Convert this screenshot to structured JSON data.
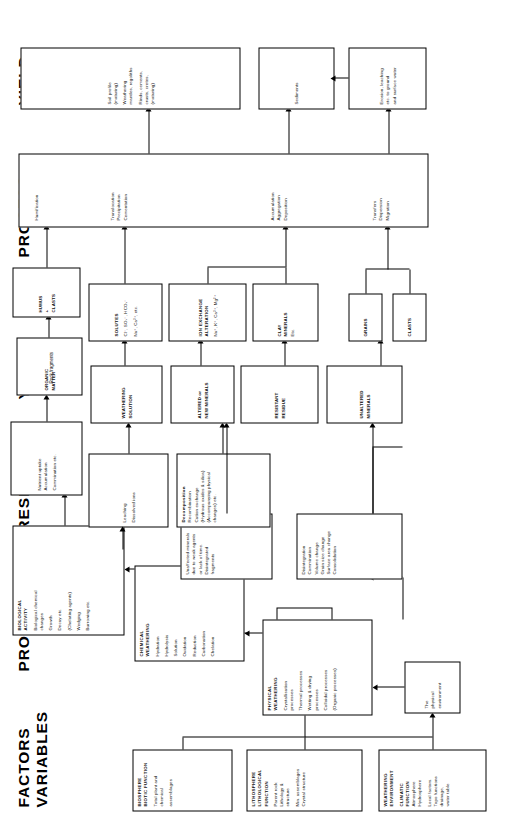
{
  "figure": {
    "column_headers": [
      {
        "id": "factors-variables",
        "label": "FACTORS\nVARIABLES"
      },
      {
        "id": "process-1",
        "label": "PROCESS"
      },
      {
        "id": "response",
        "label": "RESPONSE"
      },
      {
        "id": "yield-1",
        "label": "YIELD"
      },
      {
        "id": "process-2",
        "label": "PROCESS"
      },
      {
        "id": "yield-2",
        "label": "YIELD"
      }
    ],
    "factor_boxes": [
      {
        "id": "weathering-environment-climatic",
        "title": "WEATHERING\nENVIRONMENT",
        "subtitle": "CLIMATIC\nFUNCTION",
        "lines": [
          "Atmosphere",
          "Hydrosphere",
          "",
          "Local factors.",
          "Topo  functions",
          "drainage,",
          "water table"
        ]
      },
      {
        "id": "lithosphere-lithological-function",
        "title": "LITHOSPHERE\nLITHOLOGICAL\nFUNCTION",
        "subtitle": "",
        "lines": [
          "Parent rock",
          "Lithology &",
          "structure",
          "",
          "Min. assemblages",
          "Crystal structure"
        ]
      },
      {
        "id": "biosphere-biotic-function",
        "title": "BIOSPHERE\nBIOTIC FUNCTION",
        "subtitle": "",
        "lines": [
          "Total plant and",
          "chemical",
          "",
          "assemblages"
        ]
      }
    ],
    "environment_boxes": [
      {
        "id": "physical-environment",
        "lines": [
          "The",
          "physical",
          "environment"
        ]
      },
      {
        "id": "chemical-environment",
        "lines": [
          "The",
          "chemical",
          "environment"
        ]
      }
    ],
    "process_boxes": [
      {
        "id": "physical-weathering",
        "title": "PHYSICAL\nWEATHERING",
        "lines": [
          "Crystallisation",
          "processes",
          "",
          "Thermal processes",
          "",
          "Wetting & drying",
          "processes",
          "",
          "Colloidal processes",
          "",
          "(Organic processes)"
        ]
      },
      {
        "id": "chemical-weathering",
        "title": "CHEMICAL\nWEATHERING",
        "lines": [
          "Hydration",
          "",
          "Hydrolysis",
          "",
          "Solution",
          "",
          "Oxidation",
          "",
          "Reduction",
          "",
          "Carbonation",
          "",
          "Chelation"
        ]
      },
      {
        "id": "biological-activity",
        "title": "BIOLOGICAL\nACTIVITY",
        "lines": [
          "Biological chemical",
          "changes",
          "",
          "Growth",
          "",
          "Decay etc.",
          "",
          "(Chelating agents)",
          "",
          "Wedging",
          "",
          "Burrowing etc."
        ]
      }
    ],
    "response_boxes": [
      {
        "id": "physical-response",
        "lines": [
          "Disintegration",
          "Comminution",
          "Volume change",
          "Grain size change",
          "Surface area change",
          "Consolidation"
        ]
      },
      {
        "id": "unaffected-minerals-response",
        "lines": [
          "Unaffected minerals",
          "due to weak agents",
          "or lack of time.",
          "Disintegrated",
          "fragments"
        ]
      },
      {
        "id": "chemical-response",
        "title": "Decomposition",
        "lines": [
          "Recombination",
          "Cation exchange",
          "(Hydrous oxides & silica)",
          "(Accompanying physical",
          "changes) etc."
        ]
      },
      {
        "id": "leaching-response",
        "lines": [
          "Leaching",
          "",
          "Dissolved ions"
        ]
      },
      {
        "id": "biological-response",
        "lines": [
          "Nutrient  uptake",
          "Accumulation",
          "",
          "Comminution etc."
        ]
      }
    ],
    "yield1_boxes": [
      {
        "id": "unaltered-minerals",
        "lines": [
          "UNALTERED",
          "MINERALS"
        ]
      },
      {
        "id": "resistant-residue",
        "lines": [
          "RESISTANT",
          "RESIDUE"
        ]
      },
      {
        "id": "altered-new-minerals",
        "lines": [
          "ALTERED  or",
          "NEW MINERALS"
        ]
      },
      {
        "id": "weathering-solution",
        "lines": [
          "WEATHERING",
          "SOLUTION"
        ]
      },
      {
        "id": "organic-matter",
        "lines": [
          "ORGANIC",
          "MATTER"
        ]
      }
    ],
    "yield1_sub_boxes": [
      {
        "id": "clasts",
        "lines": [
          "CLASTS"
        ]
      },
      {
        "id": "grains",
        "lines": [
          "GRAINS"
        ]
      },
      {
        "id": "clay-minerals",
        "lines": [
          "CLAY",
          "MINERALS",
          "Etc."
        ]
      },
      {
        "id": "ion-exchange-alteration",
        "title": "ION EXCHANGE\nALTERATION",
        "lines": [
          "Na⁺, K⁺, Ca²⁺,  Mg²⁺"
        ]
      },
      {
        "id": "solutes",
        "title": "SOLUTES",
        "lines": [
          "Cl⁻,  SO₄⁻,  HCO₃⁻",
          "",
          "Na⁺, Ca²⁺, etc."
        ]
      },
      {
        "id": "humus-clasts",
        "lines": [
          "HUMUS",
          "+",
          "CLASTS"
        ]
      },
      {
        "id": "rock-fragments",
        "lines": [
          "Rock  fragments"
        ]
      }
    ],
    "process2_box": {
      "id": "transport-process",
      "groups": [
        {
          "lines": [
            "Transfers",
            "Dispersion",
            "Migration"
          ]
        },
        {
          "lines": [
            "Accumulation",
            "Aggregation",
            "Deposition"
          ]
        },
        {
          "lines": [
            "Translocation",
            "Precipitation",
            "Cementation"
          ]
        },
        {
          "lines": [
            "Humification"
          ]
        }
      ]
    },
    "yield2_boxes": [
      {
        "id": "erosion-leaching",
        "lines": [
          "Erosion, leaching",
          "etc. to ground",
          "and surface water"
        ]
      },
      {
        "id": "sediments",
        "lines": [
          "Sediments"
        ]
      },
      {
        "id": "soil-profile",
        "lines": [
          "Soil  profile",
          "(maturing)",
          "",
          "Weathering",
          "mantles, regoliths",
          "",
          "Rinds,  cements,",
          "crusts,  cretes,",
          "(maturing)"
        ]
      }
    ],
    "annotations": [
      {
        "id": "note-question",
        "text": "?"
      }
    ]
  }
}
